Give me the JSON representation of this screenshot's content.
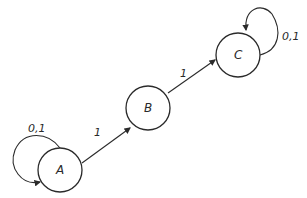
{
  "diagram": {
    "type": "state-machine",
    "nodes": [
      {
        "id": "A",
        "label": "A",
        "self_loop_label": "0,1"
      },
      {
        "id": "B",
        "label": "B"
      },
      {
        "id": "C",
        "label": "C",
        "self_loop_label": "0,1"
      }
    ],
    "edges": [
      {
        "from": "A",
        "to": "B",
        "label": "1"
      },
      {
        "from": "B",
        "to": "C",
        "label": "1"
      },
      {
        "from": "A",
        "to": "A",
        "label": "0,1"
      },
      {
        "from": "C",
        "to": "C",
        "label": "0,1"
      }
    ],
    "colors": {
      "ink": "#2a2a2a",
      "background": "#ffffff"
    }
  }
}
